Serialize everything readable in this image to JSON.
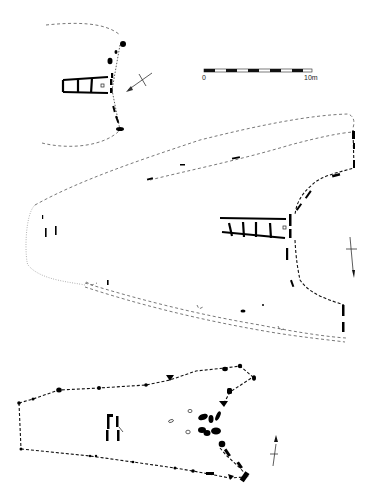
{
  "figure": {
    "type": "archaeological site plans",
    "plans": [
      {
        "id": "plan-top",
        "label": "",
        "features": [
          "dashed mound outline",
          "stone facade",
          "passage with 3 cells"
        ],
        "north_arrow": "pointing south-west"
      },
      {
        "id": "plan-middle",
        "label": "",
        "features": [
          "dashed double mound outline",
          "dotted western end",
          "stone facade with forecourt",
          "passage with 4 cells"
        ],
        "north_arrow": "pointing south"
      },
      {
        "id": "plan-bottom",
        "label": "",
        "features": [
          "dotted kerb outline with stones",
          "V-shaped forecourt with orthostats",
          "small chamber stones",
          "three open stone holes"
        ],
        "north_arrow": "pointing north"
      }
    ]
  },
  "scale_bar": {
    "start_label": "0",
    "end_label": "10m",
    "segments": 10
  },
  "colors": {
    "ink": "#000000",
    "outline": "#555555",
    "background": "#ffffff"
  }
}
